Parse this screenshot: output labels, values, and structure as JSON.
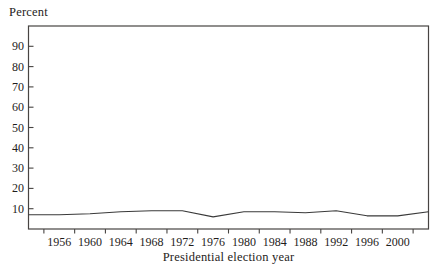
{
  "chart": {
    "top_label": "Percent",
    "x_axis_title": "Presidential election year",
    "colors": {
      "line": "#3a3a3a",
      "axis": "#474442",
      "text": "#1f1d1b",
      "background": "#ffffff"
    }
  },
  "chart_data": {
    "type": "line",
    "title": "",
    "xlabel": "Presidential election year",
    "ylabel": "Percent",
    "x": [
      1952,
      1956,
      1960,
      1964,
      1968,
      1972,
      1976,
      1980,
      1984,
      1988,
      1992,
      1996,
      2000,
      2004
    ],
    "values": [
      7,
      7,
      7.5,
      8.5,
      9,
      9,
      6,
      8.5,
      8.5,
      8,
      9,
      6.5,
      6.5,
      8.5
    ],
    "xlim": [
      1952,
      2004
    ],
    "ylim": [
      0,
      100
    ],
    "yticks": [
      10,
      20,
      30,
      40,
      50,
      60,
      70,
      80,
      90
    ],
    "xticks": [
      1954,
      1958,
      1962,
      1966,
      1970,
      1974,
      1978,
      1982,
      1986,
      1990,
      1994,
      1998,
      2002
    ],
    "xtick_labels": [
      1956,
      1960,
      1964,
      1968,
      1972,
      1976,
      1980,
      1984,
      1988,
      1992,
      1996,
      2000
    ],
    "grid": false,
    "legend": false,
    "frame": "box",
    "series": [
      {
        "name": "percent",
        "values": [
          7,
          7,
          7.5,
          8.5,
          9,
          9,
          6,
          8.5,
          8.5,
          8,
          9,
          6.5,
          6.5,
          8.5
        ]
      }
    ]
  }
}
